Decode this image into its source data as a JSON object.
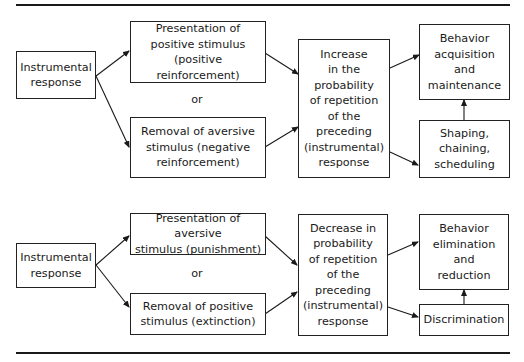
{
  "top_section": {
    "instrumental": "Instrumental\nresponse",
    "positive_presentation": "Presentation of\npositive stimulus\n(positive reinforcement)",
    "or": "or",
    "aversive_removal": "Removal of aversive\nstimulus (negative\nreinforcement)",
    "increase": "Increase\nin the\nprobability\nof repetition\nof the\npreceding\n(instrumental)\nresponse",
    "acquisition": "Behavior\nacquisition\nand\nmaintenance",
    "shaping": "Shaping,\nchaining,\nscheduling"
  },
  "bottom_section": {
    "instrumental": "Instrumental\nresponse",
    "aversive_presentation": "Presentation of aversive\nstimulus (punishment)",
    "or": "or",
    "positive_removal": "Removal of positive\nstimulus (extinction)",
    "decrease": "Decrease in\nprobability\nof repetition\nof the\npreceding\n(instrumental)\nresponse",
    "elimination": "Behavior\nelimination\nand\nreduction",
    "discrimination": "Discrimination"
  },
  "colors": {
    "line": "#1a1a1a",
    "background": "#ffffff"
  }
}
